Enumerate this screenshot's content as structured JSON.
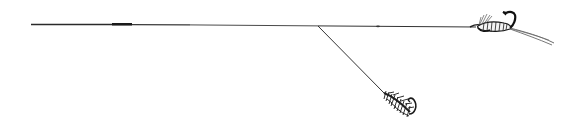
{
  "illustration": {
    "subject": "fishing cast with point fly and dropper fly",
    "background": "#ffffff",
    "ink": "#1a1a1a",
    "elements": {
      "main_line": "leader-line",
      "dropper": "dropper-line",
      "point_fly": "winged-fly",
      "dropper_fly": "hackled-fly"
    }
  }
}
